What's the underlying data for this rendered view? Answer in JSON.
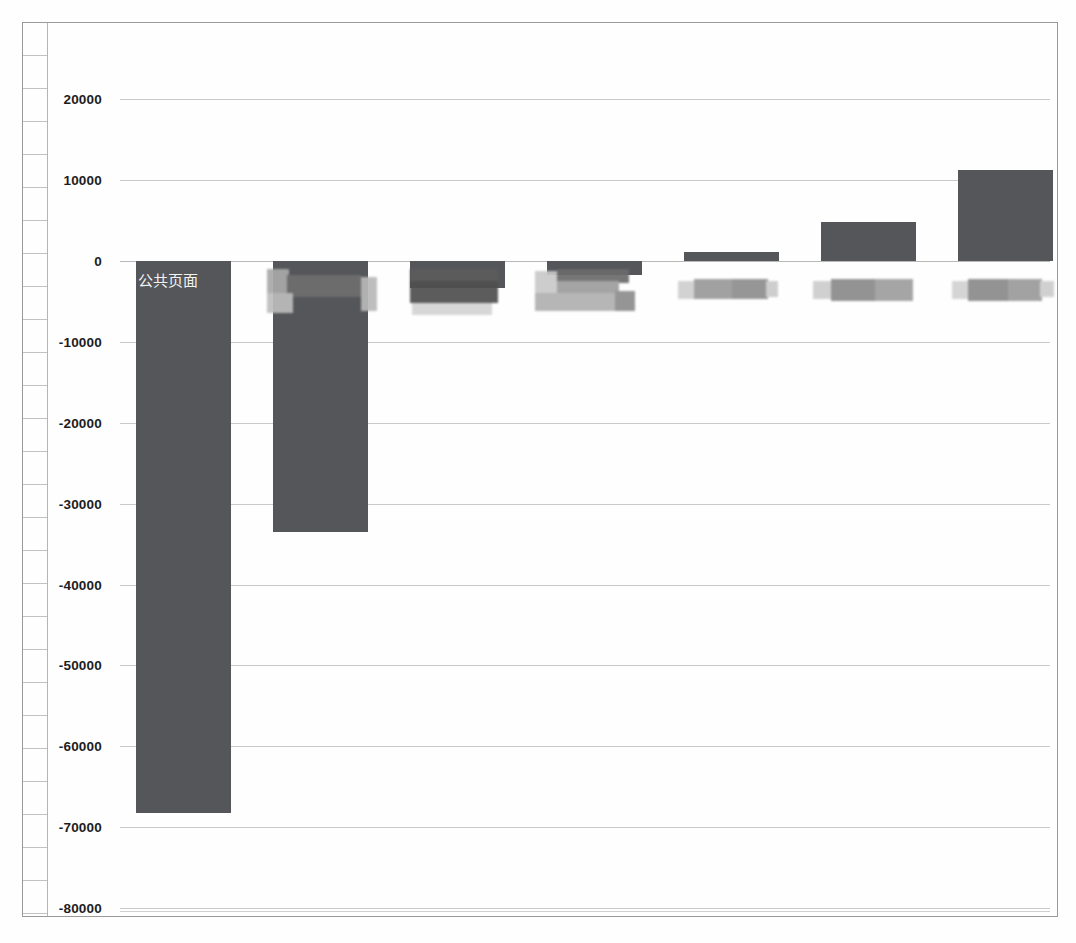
{
  "chart_data": {
    "type": "bar",
    "title": "",
    "subtitle": "",
    "xlabel": "",
    "ylabel": "",
    "ylim": [
      -80000,
      25000
    ],
    "grid": true,
    "legend": "none",
    "tick_labels": [
      "20000",
      "10000",
      "0",
      "-10000",
      "-20000",
      "-30000",
      "-40000",
      "-50000",
      "-60000",
      "-70000",
      "-80000"
    ],
    "tick_values": [
      20000,
      10000,
      0,
      -10000,
      -20000,
      -30000,
      -40000,
      -50000,
      -60000,
      -70000,
      -80000
    ],
    "categories": [
      "公共页面",
      "",
      "",
      "",
      "",
      "",
      ""
    ],
    "category_labels_redacted": [
      false,
      true,
      true,
      true,
      true,
      true,
      true
    ],
    "values": [
      -68200,
      -33500,
      -3350,
      -1700,
      1100,
      4850,
      11300
    ],
    "bar_color": "#55565a",
    "gridline_color": "#c9c9c9",
    "annotations": [
      {
        "text": "公共页面",
        "on_bar_index": 0,
        "color": "#f2f2f2"
      }
    ]
  },
  "axis": {
    "tick_0": "20000",
    "tick_1": "10000",
    "tick_2": "0",
    "tick_3": "-10000",
    "tick_4": "-20000",
    "tick_5": "-30000",
    "tick_6": "-40000",
    "tick_7": "-50000",
    "tick_8": "-60000",
    "tick_9": "-70000",
    "tick_10": "-80000"
  },
  "labels": {
    "bar_0_text": "公共页面"
  }
}
